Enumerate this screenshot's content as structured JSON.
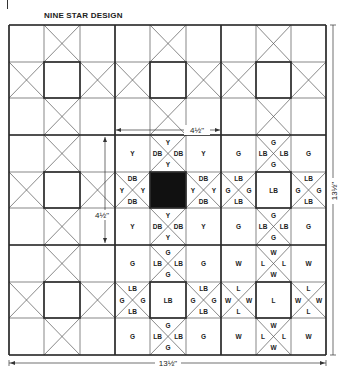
{
  "title": "NINE STAR DESIGN",
  "dimensions": {
    "block_width": "4½\"",
    "block_height": "4½\"",
    "total_width": "13½\"",
    "total_height": "13½\""
  },
  "grid": {
    "blocks": 3,
    "cells_per_block": 3,
    "x_lines": [
      9,
      44,
      80,
      115,
      150,
      186,
      221,
      256,
      291,
      326
    ],
    "y_lines": [
      25,
      62,
      98,
      135,
      172,
      208,
      245,
      282,
      318,
      355
    ]
  },
  "blocks": [
    {
      "row": 0,
      "col": 0,
      "labels": null
    },
    {
      "row": 0,
      "col": 1,
      "labels": null
    },
    {
      "row": 0,
      "col": 2,
      "labels": null
    },
    {
      "row": 1,
      "col": 0,
      "labels": null
    },
    {
      "row": 1,
      "col": 1,
      "corner": "Y",
      "edge_tri_center": "DB",
      "edge_tri_outer": "Y",
      "center": "",
      "center_fill": "#111111"
    },
    {
      "row": 1,
      "col": 2,
      "corner": "G",
      "edge_tri_center": "LB",
      "edge_tri_outer": "G",
      "center": "LB",
      "center_fill": "#ffffff"
    },
    {
      "row": 2,
      "col": 0,
      "labels": null
    },
    {
      "row": 2,
      "col": 1,
      "corner": "G",
      "edge_tri_center": "LB",
      "edge_tri_outer": "G",
      "center": "LB",
      "center_fill": "#ffffff"
    },
    {
      "row": 2,
      "col": 2,
      "corner": "W",
      "edge_tri_center": "L",
      "edge_tri_outer": "W",
      "center": "L",
      "center_fill": "#ffffff"
    }
  ],
  "colors": {
    "line": "#2a2a2a",
    "thin_line": "#555555",
    "dark_center": "#111111"
  }
}
